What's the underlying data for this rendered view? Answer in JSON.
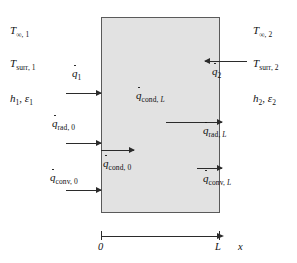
{
  "diagram": {
    "type": "one-dimensional-wall-conduction-surface-energy-balance",
    "slab": {
      "fill_color": "#e2e2e2",
      "border_color": "#5a5a5a"
    },
    "axis": {
      "variable": "x",
      "ticks": [
        {
          "label": "0",
          "position": "left-face"
        },
        {
          "label": "L",
          "position": "right-face"
        }
      ]
    },
    "left_conditions": [
      {
        "base": "T",
        "sub": "∞, 1"
      },
      {
        "base": "T",
        "sub": "surr, 1"
      },
      {
        "base": "h",
        "sub": "1",
        "base2": "ε",
        "sub2": "1"
      }
    ],
    "right_conditions": [
      {
        "base": "T",
        "sub": "∞, 2"
      },
      {
        "base": "T",
        "sub": "surr, 2"
      },
      {
        "base": "h",
        "sub": "2",
        "base2": "ε",
        "sub2": "2"
      }
    ],
    "labels": {
      "q1": {
        "base": "q",
        "sub": "1"
      },
      "q2": {
        "base": "q",
        "sub": "2"
      },
      "q_cond_L": {
        "base": "q",
        "sub": "cond, ",
        "subi": "L"
      },
      "q_cond_0": {
        "base": "q",
        "sub": "cond, 0"
      },
      "q_rad_0": {
        "base": "q",
        "sub": "rad, 0"
      },
      "q_rad_L": {
        "base": "q",
        "sub": "rad, ",
        "subi": "L"
      },
      "q_conv_0": {
        "base": "q",
        "sub": "conv, 0"
      },
      "q_conv_L": {
        "base": "q",
        "sub": "conv, ",
        "subi": "L"
      },
      "axis_x": "x",
      "tick_0": "0",
      "tick_L": "L"
    },
    "arrows": [
      {
        "name": "q1-arrow",
        "direction": "right",
        "target": "left-face"
      },
      {
        "name": "q2-arrow",
        "direction": "left",
        "target": "right-face"
      },
      {
        "name": "q-cond-L-arrow",
        "direction": "right",
        "target": "right-face-exit"
      },
      {
        "name": "q-rad-0-arrow",
        "direction": "right",
        "target": "left-face"
      },
      {
        "name": "q-cond-0-arrow",
        "direction": "right",
        "target": "interior"
      },
      {
        "name": "q-conv-0-arrow",
        "direction": "right",
        "target": "left-face"
      },
      {
        "name": "q-rad-L-arrow",
        "direction": "right",
        "target": "right-face-exit"
      },
      {
        "name": "q-conv-L-arrow",
        "direction": "right",
        "target": "right-face-exit"
      }
    ]
  }
}
